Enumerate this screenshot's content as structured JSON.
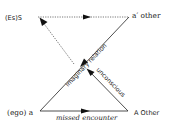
{
  "diagram": {
    "nodes": {
      "top_left": "(Es)S",
      "top_right": "a′ other",
      "bottom_left": "(ego) a",
      "bottom_right": "A Other"
    },
    "edges": {
      "imaginary": "imaginary relation",
      "unconscious": "unconscious",
      "missed": "missed encounter"
    },
    "colors": {
      "line": "#222222",
      "dotted": "#555555",
      "text": "#222222"
    }
  }
}
